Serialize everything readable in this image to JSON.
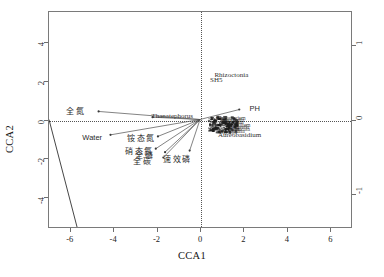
{
  "chart_data": {
    "type": "scatter",
    "title": "",
    "xlabel": "CCA1",
    "ylabel": "CCA2",
    "xlim": [
      -7.0,
      7.0
    ],
    "ylim": [
      -5.6,
      5.6
    ],
    "xticks": [
      "-6",
      "-4",
      "-2",
      "0",
      "2",
      "4",
      "6"
    ],
    "xtickvals": [
      -6,
      -4,
      -2,
      0,
      2,
      4,
      6
    ],
    "yticks": [
      "-4",
      "-2",
      "0",
      "2",
      "4"
    ],
    "ytickvals": [
      -4,
      -2,
      0,
      2,
      4
    ],
    "y2ticks": [
      "-1",
      "0",
      "1"
    ],
    "y2tickvals": [
      -1,
      0,
      1
    ],
    "grid": false,
    "legend": "none",
    "zero_lines": {
      "x": 0,
      "y": 0,
      "style": "dotted"
    },
    "env_vectors": [
      {
        "label": "全氮",
        "x": -5.0,
        "y": 0.45,
        "tip_x": -4.7,
        "tip_y": 0.42
      },
      {
        "label": "Thanatephorus",
        "x": -3.05,
        "y": 0.18,
        "tip_x": -2.2,
        "tip_y": 0.12,
        "is_species": true
      },
      {
        "label": "Water",
        "x": -4.45,
        "y": -0.88,
        "tip_x": -4.15,
        "tip_y": -0.8
      },
      {
        "label": "铵态氮",
        "x": -2.2,
        "y": -0.95,
        "tip_x": -1.95,
        "tip_y": -0.88
      },
      {
        "label": "硝态氮",
        "x": -2.3,
        "y": -1.62,
        "tip_x": -2.05,
        "tip_y": -1.52
      },
      {
        "label": "全磷",
        "x": -1.82,
        "y": -1.82,
        "tip_x": -1.62,
        "tip_y": -1.7
      },
      {
        "label": "全碳",
        "x": -1.92,
        "y": -2.12,
        "tip_x": -1.7,
        "tip_y": -1.98
      },
      {
        "label": "速效磷",
        "x": -0.55,
        "y": -2.05,
        "tip_x": -0.48,
        "tip_y": -1.62
      },
      {
        "label": "PH",
        "x": 2.1,
        "y": 0.58,
        "tip_x": 1.82,
        "tip_y": 0.52
      }
    ],
    "species_labels": [
      {
        "label": "Rhizoctonia",
        "x": 0.62,
        "y": 2.3
      },
      {
        "label": "SH5",
        "x": 0.42,
        "y": 2.05
      },
      {
        "label": "Aureobasidium",
        "x": 0.78,
        "y": -0.78
      },
      {
        "label": "Thanatephorus",
        "x": -2.28,
        "y": 0.17
      },
      {
        "label": "PH",
        "x": 2.22,
        "y": 0.6
      },
      {
        "label": "Water",
        "x": -4.58,
        "y": -0.92
      }
    ],
    "cluster_labels": [
      {
        "label": "Cladosporium",
        "x": 0.7,
        "y": 0.1
      },
      {
        "label": "Mortierella",
        "x": 0.92,
        "y": -0.02
      },
      {
        "label": "Fusarium",
        "x": 1.05,
        "y": -0.14
      },
      {
        "label": "Penicillium",
        "x": 1.18,
        "y": -0.26
      },
      {
        "label": "Gibberella",
        "x": 1.22,
        "y": -0.38
      },
      {
        "label": "Humicola",
        "x": 1.3,
        "y": -0.48
      },
      {
        "label": "Alternaria",
        "x": 1.05,
        "y": -0.58
      },
      {
        "label": "Myceps",
        "x": 0.88,
        "y": -0.66
      }
    ],
    "reference_line": {
      "description": "solid line from left frame edge descending to bottom frame edge",
      "x1": -7.0,
      "y1": 0.0,
      "x2": -5.7,
      "y2": -5.6
    },
    "point_count_note": "dense overlapping species point cloud near origin, slightly right of CCA1 = 0"
  },
  "figure": {
    "caption": ""
  }
}
